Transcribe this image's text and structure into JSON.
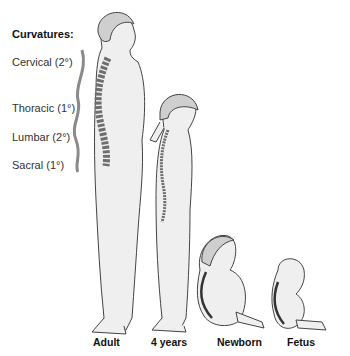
{
  "legend": {
    "title": "Curvatures:",
    "items": [
      {
        "label": "Cervical (2°)",
        "top": 56
      },
      {
        "label": "Thoracic (1°)",
        "top": 102
      },
      {
        "label": "Lumbar (2°)",
        "top": 131
      },
      {
        "label": "Sacral (1°)",
        "top": 159
      }
    ]
  },
  "figures": [
    {
      "caption": "Adult",
      "left": 93
    },
    {
      "caption": "4 years",
      "left": 151
    },
    {
      "caption": "Newborn",
      "left": 217
    },
    {
      "caption": "Fetus",
      "left": 287
    }
  ],
  "colors": {
    "skin": "#efefef",
    "hair": "#cfcfcf",
    "outline": "#444444",
    "spine": "#6e6e6e",
    "curve_bar": "#8a8a8a"
  }
}
